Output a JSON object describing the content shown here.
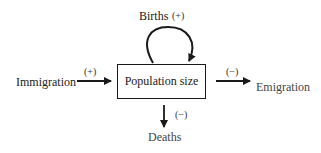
{
  "diagram": {
    "central_node": "Population size",
    "inflows": [
      {
        "label": "Births",
        "sign": "(+)"
      },
      {
        "label": "Immigration",
        "sign": "(+)"
      }
    ],
    "outflows": [
      {
        "label": "Emigration",
        "sign": "(−)"
      },
      {
        "label": "Deaths",
        "sign": "(−)"
      }
    ]
  }
}
